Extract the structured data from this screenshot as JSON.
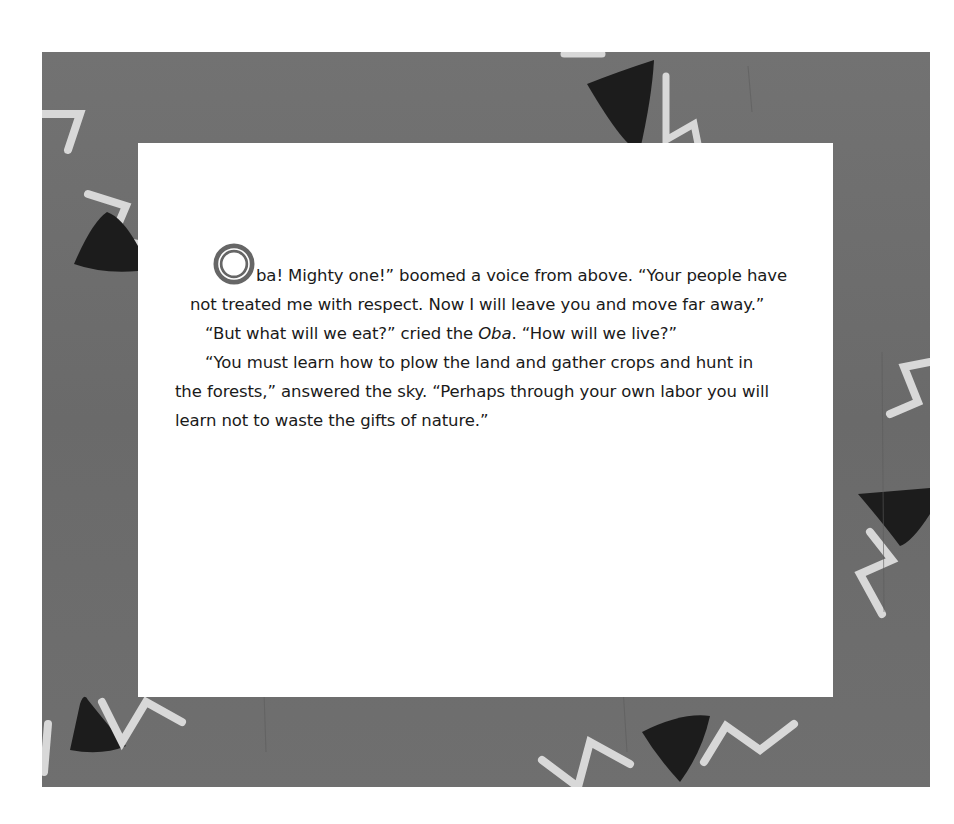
{
  "page": {
    "colors": {
      "frame": "#6e6e6e",
      "page": "#ffffff",
      "text": "#1a1a1a",
      "dropcap": "#666666",
      "triangle": "#1c1c1c",
      "zigzag": "#d8d8d8"
    }
  },
  "story": {
    "dropcap_letter": "O",
    "paragraphs": [
      {
        "first_line_rest": "ba! Mighty one!” boomed a voice from above. “Your people have",
        "rest": "not treated me with respect. Now I will leave you and move far away.”"
      },
      {
        "before_em": "“But what will we eat?” cried the ",
        "em": "Oba",
        "after_em": ". “How will we live?”"
      },
      {
        "text_line1": "“You must learn how to plow the land and gather crops and hunt in",
        "text_line2": "the forests,” answered the sky. “Perhaps through your own labor you will",
        "text_line3": "learn not to waste the gifts of nature.”"
      }
    ]
  },
  "decorations": {
    "icons": [
      "triangle-icon",
      "zigzag-icon"
    ]
  }
}
